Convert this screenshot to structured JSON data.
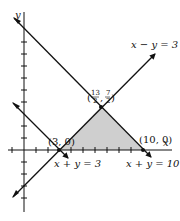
{
  "figure": {
    "type": "linear-inequality-graph",
    "axes": {
      "x_label": "x",
      "y_label": "y",
      "tick_spacing": 1,
      "x_ticks_visible": [
        -1,
        1,
        2,
        3,
        4,
        5,
        6,
        7,
        8,
        9,
        10
      ],
      "y_ticks_visible": [
        -5,
        -4,
        -3,
        -2,
        -1,
        1,
        2,
        3,
        4,
        5,
        6,
        7,
        8,
        9,
        10
      ]
    },
    "lines": [
      {
        "equation": "x − y = 3",
        "label": "x − y = 3"
      },
      {
        "equation": "x + y = 3",
        "label": "x + y = 3"
      },
      {
        "equation": "x + y = 10",
        "label": "x + y = 10"
      }
    ],
    "vertices": [
      {
        "label": "(3, 0)",
        "x": 3,
        "y": 0
      },
      {
        "label": "(10, 0)",
        "x": 10,
        "y": 0
      },
      {
        "label_num_x": "13",
        "label_den_x": "2",
        "label_num_y": "7",
        "label_den_y": "2",
        "x": 6.5,
        "y": 3.5
      }
    ],
    "shaded_region": {
      "vertices": [
        [
          3,
          0
        ],
        [
          10,
          0
        ],
        [
          6.5,
          3.5
        ]
      ],
      "color": "#cfcfcf"
    },
    "line_color": "#111111"
  }
}
